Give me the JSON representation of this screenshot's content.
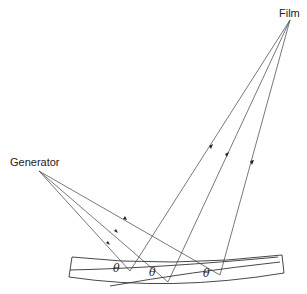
{
  "labels": {
    "film": "Film",
    "generator": "Generator"
  },
  "angle_labels": [
    "θ",
    "θ",
    "θ"
  ],
  "colors": {
    "line": "#555555",
    "text": "#222222",
    "background": "#ffffff"
  }
}
